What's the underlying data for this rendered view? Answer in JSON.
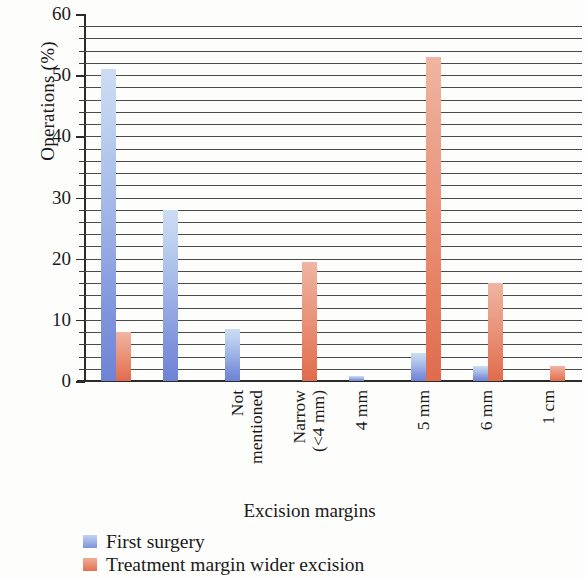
{
  "chart_data": {
    "type": "bar",
    "title": "",
    "xlabel": "Excision margins",
    "ylabel": "Operations (%)",
    "ylim": [
      0,
      60
    ],
    "ytick_step": 10,
    "minor_tick_step": 2,
    "grid": true,
    "grid_orientation": "horizontal",
    "legend_position": "below-left",
    "categories": [
      "Not\nmentioned",
      "Narrow\n(<4 mm)",
      "4 mm",
      "5 mm",
      "6 mm",
      "1 cm",
      "2 cm",
      "3 cm"
    ],
    "yticks": [
      "0",
      "10",
      "20",
      "30",
      "40",
      "50",
      "60"
    ],
    "series": [
      {
        "name": "First surgery",
        "color": "#8094dd",
        "values": [
          51,
          28,
          8.5,
          0,
          0.8,
          4.5,
          2.5,
          0
        ]
      },
      {
        "name": "Treatment margin wider excision",
        "color": "#e4795b",
        "values": [
          8,
          0,
          0,
          19.5,
          0,
          53,
          16,
          2.5
        ]
      }
    ]
  },
  "colors": {
    "series_blue": "#8094dd",
    "series_red": "#e4795b",
    "axis": "#2b2b2b",
    "grid": "#4a4a48",
    "background": "#fdfdfb"
  }
}
